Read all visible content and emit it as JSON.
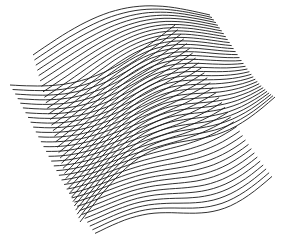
{
  "artwork": {
    "description": "Two overlapping sheets of dense parallel curved lines forming a moire pattern",
    "background": "#ffffff",
    "stroke_color": "#1a1a1a",
    "sheets": [
      {
        "name": "back-sheet",
        "lines": 34,
        "corners": {
          "tl": [
            10,
            85
          ],
          "tr": [
            175,
            25
          ],
          "br": [
            272,
            175
          ],
          "bl": [
            95,
            232
          ]
        },
        "bow": -22,
        "wave": 10
      },
      {
        "name": "front-sheet",
        "lines": 34,
        "corners": {
          "tl": [
            33,
            55
          ],
          "tr": [
            210,
            15
          ],
          "br": [
            275,
            95
          ],
          "bl": [
            80,
            220
          ]
        },
        "bow": 26,
        "wave": 14
      }
    ]
  }
}
